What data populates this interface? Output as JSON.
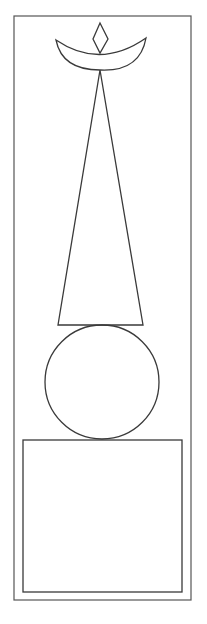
{
  "figure": {
    "stroke_color": "#3a3a3a",
    "frame_color": "#555555",
    "background": "#ffffff",
    "shapes": [
      "outer-frame",
      "diamond",
      "crescent",
      "tall-triangle",
      "circle",
      "square"
    ]
  }
}
